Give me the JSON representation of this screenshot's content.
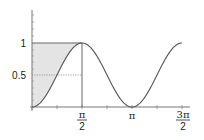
{
  "chart_data": {
    "type": "line",
    "title": "",
    "xlabel": "",
    "ylabel": "",
    "function": "sin^2(x)",
    "xlim": [
      0,
      4.712
    ],
    "ylim": [
      0,
      1.25
    ],
    "grid": false,
    "x_tick_labels": [
      "π/2",
      "π",
      "3π/2"
    ],
    "x_ticks": [
      1.5708,
      3.1416,
      4.7124
    ],
    "y_tick_labels": [
      "0.5",
      "1"
    ],
    "y_ticks": [
      0.5,
      1
    ],
    "series": [
      {
        "name": "sin²(x)",
        "x": [
          0,
          0.393,
          0.785,
          1.178,
          1.571,
          1.963,
          2.356,
          2.749,
          3.142,
          3.534,
          3.927,
          4.32,
          4.712
        ],
        "values": [
          0,
          0.146,
          0.5,
          0.854,
          1,
          0.854,
          0.5,
          0.146,
          0,
          0.146,
          0.5,
          0.854,
          1
        ]
      }
    ],
    "annotations": [
      {
        "type": "shaded-region",
        "description": "area between y=1 and the curve for x in [0, π/2]",
        "color": "#e6e6e6"
      },
      {
        "type": "reference-line",
        "description": "dotted horizontal line at y=0.5 from 0 to π/2"
      },
      {
        "type": "reference-line",
        "description": "vertical line at x=π/2 from 0 to 1"
      }
    ]
  },
  "labels": {
    "y1": "1",
    "y05": "0.5",
    "xpi": "π",
    "x_half_num": "π",
    "x_half_den": "2",
    "x_3half_num": "3π",
    "x_3half_den": "2"
  },
  "colors": {
    "curve": "#555555",
    "axis": "#666666",
    "shade": "#e4e4e4"
  }
}
